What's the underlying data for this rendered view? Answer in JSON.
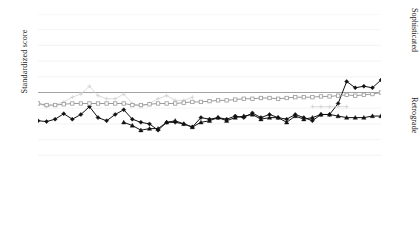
{
  "axes": {
    "y_title": "Standardized score",
    "right_top_label": "Sophisticated",
    "right_bottom_label": "Retrograde"
  },
  "chart_data": {
    "type": "line",
    "title": "",
    "xlabel": "",
    "ylabel": "Standardized score",
    "xlim": [
      1975,
      2015
    ],
    "ylim": [
      0,
      100
    ],
    "ytick_values": [
      0,
      10,
      20,
      30,
      40,
      50,
      60,
      70,
      80,
      90,
      100
    ],
    "xtick_labels": [
      "1975",
      "1980",
      "1985",
      "1990",
      "1995",
      "2000",
      "2005",
      "2010",
      "2015"
    ],
    "xtick_values": [
      1975,
      1980,
      1985,
      1990,
      1995,
      2000,
      2005,
      2010,
      2015
    ],
    "minor_xticks_every": 1,
    "grid": true,
    "grid_axis": "y",
    "legend_position": "bottom",
    "reference_line": {
      "value": 50,
      "color": "#9a9a9a",
      "label": ""
    },
    "annotations": [
      {
        "text": "Sophisticated",
        "position": "right-axis-top"
      },
      {
        "text": "Retrograde",
        "position": "right-axis-bottom"
      }
    ],
    "x": [
      1975,
      1976,
      1977,
      1978,
      1979,
      1980,
      1981,
      1982,
      1983,
      1984,
      1985,
      1986,
      1987,
      1988,
      1989,
      1990,
      1991,
      1992,
      1993,
      1994,
      1995,
      1996,
      1997,
      1998,
      1999,
      2000,
      2001,
      2002,
      2003,
      2004,
      2005,
      2006,
      2007,
      2008,
      2009,
      2010,
      2011,
      2012,
      2013,
      2014,
      2015
    ],
    "series": [
      {
        "name": "Military juntas",
        "color": "#111111",
        "marker": "diamond",
        "values": [
          32,
          31.5,
          33,
          36.5,
          33,
          36,
          41,
          34,
          32,
          36,
          39,
          33,
          31,
          30,
          26,
          31,
          31,
          30,
          28,
          34,
          33,
          34,
          33,
          35,
          34,
          37,
          34,
          36,
          34,
          33,
          36,
          34,
          32,
          36,
          36,
          43,
          57,
          53,
          54,
          53,
          58
        ]
      },
      {
        "name": "Personalist dictators",
        "color": "#d2d2d2",
        "marker": "cross",
        "values": [
          43,
          41,
          42,
          44,
          47,
          49,
          54,
          48,
          46,
          46,
          49,
          43,
          41,
          43,
          46,
          48,
          45,
          45,
          47,
          null,
          null,
          null,
          null,
          null,
          null,
          null,
          null,
          null,
          null,
          null,
          null,
          null,
          41,
          41,
          41,
          41,
          41,
          null,
          null,
          null,
          null
        ]
      },
      {
        "name": "Monarchical families",
        "color": "#111111",
        "marker": "triangle",
        "values": [
          null,
          null,
          null,
          null,
          null,
          null,
          null,
          null,
          null,
          null,
          31,
          29,
          26,
          27,
          27,
          31,
          32,
          30,
          28,
          31,
          32,
          34,
          32,
          34,
          35,
          36,
          33,
          34,
          34,
          31,
          35,
          33,
          34,
          36,
          36,
          35,
          34,
          34,
          34,
          35,
          35
        ]
      },
      {
        "name": "Single parties",
        "color": "#9a9a9a",
        "marker": "square",
        "values": [
          43,
          42,
          42,
          42.5,
          43,
          43,
          43,
          43,
          43,
          43,
          43,
          42,
          42,
          42.5,
          43,
          43,
          43,
          43.5,
          44,
          44,
          44.5,
          45,
          45,
          45.5,
          46,
          46,
          46.5,
          46.5,
          46,
          46.5,
          47,
          47,
          47,
          47.5,
          47.5,
          48,
          48.5,
          48,
          48.5,
          49,
          50
        ]
      }
    ]
  },
  "legend": {
    "items": [
      {
        "label": "Military juntas"
      },
      {
        "label": "Personalist dictators"
      },
      {
        "label": "Monarchical families"
      },
      {
        "label": "Single parties"
      }
    ]
  }
}
